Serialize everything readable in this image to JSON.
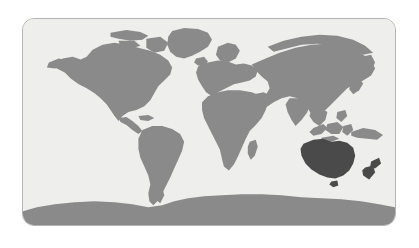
{
  "figure": {
    "kind": "world-map",
    "title": "",
    "projection": "equirectangular",
    "panel": {
      "background_color": "#eeeeec",
      "border_color": "#b4b4b4",
      "corner_radius_px": 12,
      "outer_background_color": "#ffffff"
    }
  },
  "legend": {
    "visible": false,
    "entries": [
      {
        "label": "Highlighted region",
        "color": "#4a4a4a"
      },
      {
        "label": "Other land",
        "color": "#8a8a8a"
      }
    ]
  },
  "map_data": {
    "type": "choropleth",
    "highlight_color": "#4a4a4a",
    "land_color": "#8a8a8a",
    "ocean_color": "#eeeeec",
    "highlighted_regions": [
      "Australia",
      "New Zealand",
      "Tasmania"
    ],
    "regions": [
      {
        "name": "North America",
        "highlighted": false
      },
      {
        "name": "Greenland",
        "highlighted": false
      },
      {
        "name": "South America",
        "highlighted": false
      },
      {
        "name": "Europe",
        "highlighted": false
      },
      {
        "name": "Africa",
        "highlighted": false
      },
      {
        "name": "Madagascar",
        "highlighted": false
      },
      {
        "name": "Asia",
        "highlighted": false
      },
      {
        "name": "Indonesia",
        "highlighted": false
      },
      {
        "name": "New Guinea",
        "highlighted": false
      },
      {
        "name": "Japan",
        "highlighted": false
      },
      {
        "name": "British Isles",
        "highlighted": false
      },
      {
        "name": "Iceland",
        "highlighted": false
      },
      {
        "name": "Antarctica",
        "highlighted": false
      },
      {
        "name": "Australia",
        "highlighted": true
      },
      {
        "name": "Tasmania",
        "highlighted": true
      },
      {
        "name": "New Zealand",
        "highlighted": true
      }
    ]
  }
}
